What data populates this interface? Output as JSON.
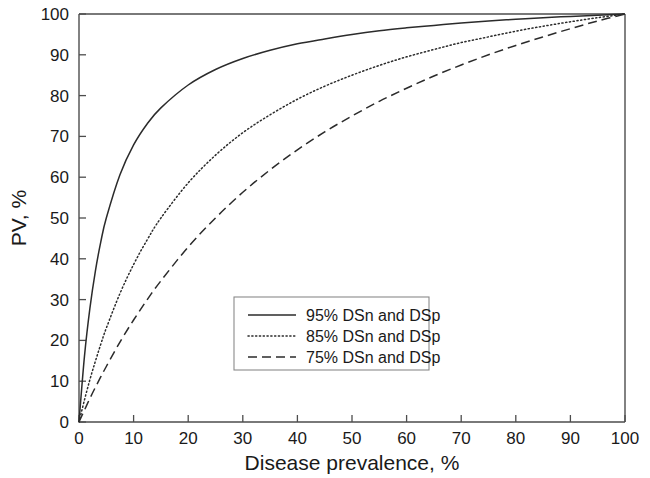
{
  "chart_data": {
    "type": "line",
    "title": "",
    "xlabel": "Disease prevalence, %",
    "ylabel": "PV, %",
    "xlim": [
      0,
      100
    ],
    "ylim": [
      0,
      100
    ],
    "xticks": [
      0,
      10,
      20,
      30,
      40,
      50,
      60,
      70,
      80,
      90,
      100
    ],
    "yticks": [
      0,
      10,
      20,
      30,
      40,
      50,
      60,
      70,
      80,
      90,
      100
    ],
    "xtick_labels": [
      "0",
      "10",
      "20",
      "30",
      "40",
      "50",
      "60",
      "70",
      "80",
      "90",
      "100"
    ],
    "ytick_labels": [
      "0",
      "10",
      "20",
      "30",
      "40",
      "50",
      "60",
      "70",
      "80",
      "90",
      "100"
    ],
    "grid": false,
    "legend_position": "center",
    "series": [
      {
        "name": "95% DSn and DSp",
        "style": "solid",
        "color": "#2b2b2b",
        "x": [
          0,
          1,
          2,
          3,
          4,
          5,
          7.5,
          10,
          12.5,
          15,
          20,
          25,
          30,
          35,
          40,
          45,
          50,
          55,
          60,
          65,
          70,
          75,
          80,
          85,
          90,
          95,
          100
        ],
        "y": [
          0,
          16.1,
          27.9,
          37.0,
          44.2,
          50.0,
          60.6,
          67.9,
          73.1,
          77.0,
          82.6,
          86.4,
          89.1,
          91.1,
          92.7,
          93.9,
          95.0,
          95.9,
          96.6,
          97.2,
          97.8,
          98.3,
          98.7,
          99.1,
          99.4,
          99.7,
          100
        ],
        "formula": "PPV = 0.95p / (0.95p + 0.05(1-p))"
      },
      {
        "name": "85% DSn and DSp",
        "style": "dotted",
        "color": "#2b2b2b",
        "x": [
          0,
          1,
          2,
          3,
          4,
          5,
          7.5,
          10,
          12.5,
          15,
          20,
          25,
          30,
          35,
          40,
          45,
          50,
          55,
          60,
          65,
          70,
          75,
          80,
          85,
          90,
          95,
          100
        ],
        "y": [
          0,
          5.4,
          10.4,
          14.9,
          19.1,
          23.0,
          31.5,
          38.6,
          44.7,
          50.0,
          58.6,
          65.4,
          70.9,
          75.3,
          79.1,
          82.3,
          85.0,
          87.4,
          89.5,
          91.3,
          93.0,
          94.4,
          95.8,
          97.0,
          98.1,
          99.1,
          100
        ]
      },
      {
        "name": "75% DSn and DSp",
        "style": "dashed",
        "color": "#2b2b2b",
        "x": [
          0,
          1,
          2,
          3,
          4,
          5,
          7.5,
          10,
          12.5,
          15,
          20,
          25,
          30,
          35,
          40,
          45,
          50,
          55,
          60,
          65,
          70,
          75,
          80,
          85,
          90,
          95,
          100
        ],
        "y": [
          0,
          2.9,
          5.8,
          8.5,
          11.1,
          13.6,
          19.6,
          25.0,
          30.0,
          34.6,
          42.9,
          50.0,
          56.3,
          61.8,
          66.7,
          71.1,
          75.0,
          78.6,
          81.8,
          84.8,
          87.5,
          90.0,
          92.3,
          94.4,
          96.4,
          98.3,
          100
        ]
      }
    ]
  },
  "legend": {
    "items": [
      {
        "label": "95% DSn and DSp",
        "style": "solid"
      },
      {
        "label": "85% DSn and DSp",
        "style": "dotted"
      },
      {
        "label": "75% DSn and DSp",
        "style": "dashed"
      }
    ]
  },
  "axes": {
    "x_title": "Disease prevalence, %",
    "y_title": "PV, %"
  }
}
